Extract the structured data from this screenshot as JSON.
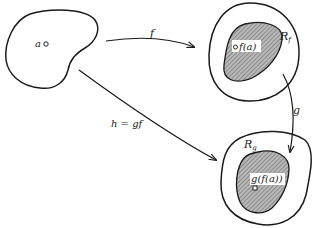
{
  "diagram": {
    "type": "function-composition-mapping",
    "colors": {
      "stroke": "#1a1a1a",
      "shade": "#9a9a9a",
      "background": "#ffffff"
    },
    "domain_set": {
      "point_label": "a"
    },
    "range_f": {
      "region_label": "R",
      "region_sub": "f",
      "point_label": "f(a)"
    },
    "range_g": {
      "region_label": "R",
      "region_sub": "g",
      "point_label": "g(f(a))"
    },
    "arrows": {
      "f": {
        "label": "f"
      },
      "g": {
        "label": "g"
      },
      "h": {
        "label": "h = gf"
      }
    }
  }
}
